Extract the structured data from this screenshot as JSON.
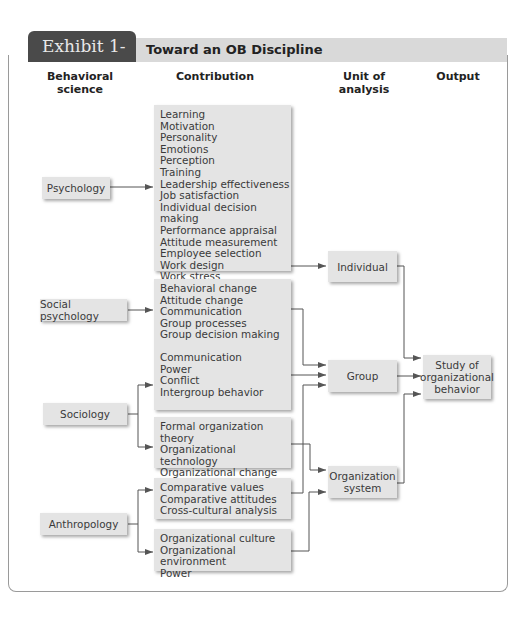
{
  "header": {
    "exhibit_prefix": "Exhibit 1-",
    "exhibit_number": "3",
    "title": "Toward an OB Discipline"
  },
  "columns": {
    "behavioral_science_line1": "Behavioral",
    "behavioral_science_line2": "science",
    "contribution": "Contribution",
    "unit_line1": "Unit of",
    "unit_line2": "analysis",
    "output": "Output"
  },
  "sciences": {
    "psychology": "Psychology",
    "social_psychology": "Social psychology",
    "sociology": "Sociology",
    "anthropology": "Anthropology"
  },
  "contributions": {
    "psychology": [
      "Learning",
      "Motivation",
      "Personality",
      "Emotions",
      "Perception",
      "Training",
      "Leadership effectiveness",
      "Job satisfaction",
      "Individual decision making",
      "Performance appraisal",
      "Attitude measurement",
      "Employee selection",
      "Work design",
      "Work stress"
    ],
    "social_psychology": [
      "Behavioral change",
      "Attitude change",
      "Communication",
      "Group processes",
      "Group decision making"
    ],
    "sociology_group": [
      "Communication",
      "Power",
      "Conflict",
      "Intergroup behavior"
    ],
    "sociology_org": [
      "Formal organization theory",
      "Organizational technology",
      "Organizational change",
      "Organizational culture"
    ],
    "anthropology_group": [
      "Comparative values",
      "Comparative attitudes",
      "Cross-cultural analysis"
    ],
    "anthropology_org": [
      "Organizational culture",
      "Organizational environment",
      "Power"
    ]
  },
  "units": {
    "individual": "Individual",
    "group": "Group",
    "org_line1": "Organization",
    "org_line2": "system"
  },
  "output": {
    "line1": "Study of",
    "line2": "organizational",
    "line3": "behavior"
  }
}
